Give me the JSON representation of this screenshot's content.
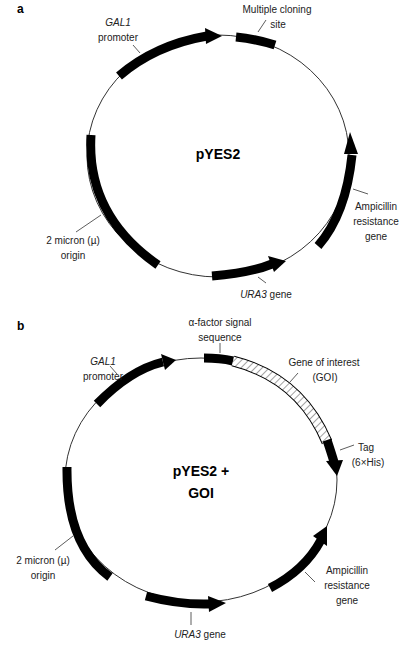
{
  "panel_a": {
    "letter": "a",
    "center_label": "pYES2",
    "labels": {
      "gal1_line1": "GAL1",
      "gal1_line2": "promoter",
      "mcs_line1": "Multiple cloning",
      "mcs_line2": "site",
      "amp_line1": "Ampicillin",
      "amp_line2": "resistance",
      "amp_line3": "gene",
      "ori_line1": "2 micron (µ)",
      "ori_line2": "origin",
      "ura3_italic": "URA3",
      "ura3_rest": " gene"
    }
  },
  "panel_b": {
    "letter": "b",
    "center_line1": "pYES2 +",
    "center_line2": "GOI",
    "labels": {
      "alpha_line1": "α-factor signal",
      "alpha_line2": "sequence",
      "gal1_line1": "GAL1",
      "gal1_line2": "promoter",
      "goi_line1": "Gene of interest",
      "goi_line2": "(GOI)",
      "tag_line1": "Tag",
      "tag_line2": "(6×His)",
      "ori_line1": "2 micron (µ)",
      "ori_line2": "origin",
      "amp_line1": "Ampicillin",
      "amp_line2": "resistance",
      "amp_line3": "gene",
      "ura3_italic": "URA3",
      "ura3_rest": " gene"
    }
  },
  "colors": {
    "feature": "#000000",
    "backbone": "#333333",
    "text": "#222222"
  }
}
